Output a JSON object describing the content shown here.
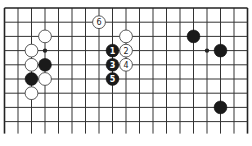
{
  "diagram": {
    "type": "go-board-fragment",
    "grid": {
      "columns": 19,
      "rows": 9,
      "x0": 4.5,
      "y0": 8,
      "dx": 13.5,
      "dy": 14.2,
      "open_bottom_extend": 12,
      "edges": [
        "top",
        "left",
        "right"
      ]
    },
    "colors": {
      "line": "#333333",
      "black_stone": "#1a1a1a",
      "white_stone": "#ffffff",
      "background": "#ffffff"
    },
    "hoshi": [
      {
        "col": 3,
        "row": 3
      },
      {
        "col": 15,
        "row": 3
      }
    ],
    "stones": [
      {
        "color": "white",
        "col": 7,
        "row": 1,
        "label": "6"
      },
      {
        "color": "white",
        "col": 3,
        "row": 2,
        "label": ""
      },
      {
        "color": "white",
        "col": 9,
        "row": 2,
        "label": ""
      },
      {
        "color": "black",
        "col": 14,
        "row": 2,
        "label": ""
      },
      {
        "color": "white",
        "col": 2,
        "row": 3,
        "label": ""
      },
      {
        "color": "black",
        "col": 8,
        "row": 3,
        "label": "1"
      },
      {
        "color": "white",
        "col": 9,
        "row": 3,
        "label": "2"
      },
      {
        "color": "black",
        "col": 16,
        "row": 3,
        "label": ""
      },
      {
        "color": "white",
        "col": 2,
        "row": 4,
        "label": ""
      },
      {
        "color": "black",
        "col": 3,
        "row": 4,
        "label": ""
      },
      {
        "color": "black",
        "col": 8,
        "row": 4,
        "label": "3"
      },
      {
        "color": "white",
        "col": 9,
        "row": 4,
        "label": "4"
      },
      {
        "color": "black",
        "col": 2,
        "row": 5,
        "label": ""
      },
      {
        "color": "white",
        "col": 3,
        "row": 5,
        "label": ""
      },
      {
        "color": "black",
        "col": 8,
        "row": 5,
        "label": "5"
      },
      {
        "color": "white",
        "col": 2,
        "row": 6,
        "label": ""
      },
      {
        "color": "black",
        "col": 16,
        "row": 7,
        "label": ""
      }
    ]
  }
}
